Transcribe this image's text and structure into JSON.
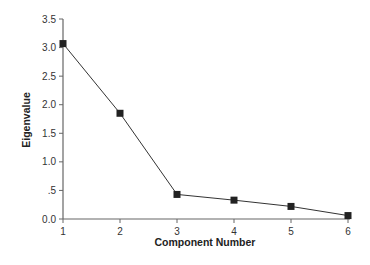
{
  "chart_data": {
    "type": "line",
    "title": "",
    "xlabel": "Component Number",
    "ylabel": "Eigenvalue",
    "x": [
      1,
      2,
      3,
      4,
      5,
      6
    ],
    "series": [
      {
        "name": "Eigenvalue",
        "values": [
          3.07,
          1.85,
          0.43,
          0.33,
          0.22,
          0.06
        ],
        "marker": "square",
        "color": "#333333"
      }
    ],
    "xlim": [
      1,
      6
    ],
    "ylim": [
      0,
      3.5
    ],
    "xticks": [
      "1",
      "2",
      "3",
      "4",
      "5",
      "6"
    ],
    "yticks": [
      {
        "value": 0.0,
        "label": "0.0"
      },
      {
        "value": 0.5,
        "label": ".5"
      },
      {
        "value": 1.0,
        "label": "1.0"
      },
      {
        "value": 1.5,
        "label": "1.5"
      },
      {
        "value": 2.0,
        "label": "2.0"
      },
      {
        "value": 2.5,
        "label": "2.5"
      },
      {
        "value": 3.0,
        "label": "3.0"
      },
      {
        "value": 3.5,
        "label": "3.5"
      }
    ],
    "grid": false,
    "legend": null
  },
  "colors": {
    "axis": "#666666",
    "line": "#333333",
    "marker": "#222222"
  }
}
